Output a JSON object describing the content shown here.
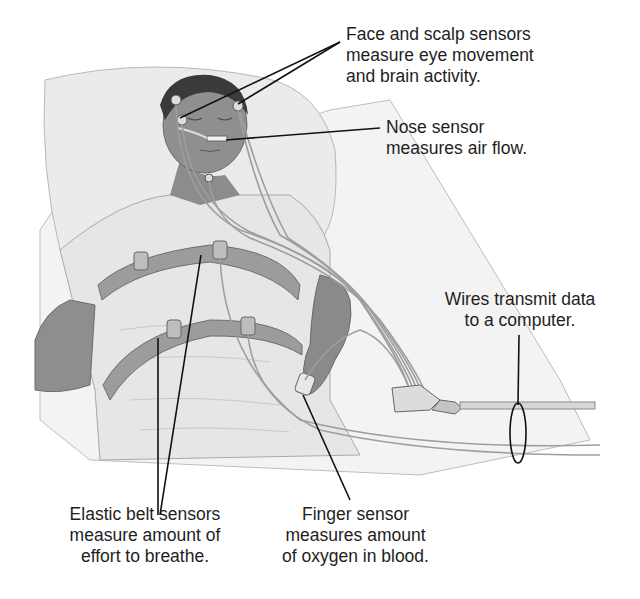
{
  "diagram": {
    "labels": {
      "face_scalp": {
        "lines": [
          "Face and scalp sensors",
          "measure eye movement",
          "and brain activity."
        ]
      },
      "nose": {
        "lines": [
          "Nose sensor",
          "measures air flow."
        ]
      },
      "wires": {
        "lines": [
          "Wires transmit data",
          "to a computer."
        ]
      },
      "belt": {
        "lines": [
          "Elastic belt sensors",
          "measure amount of",
          "effort to breathe."
        ]
      },
      "finger": {
        "lines": [
          "Finger sensor",
          "measures amount",
          "of oxygen in blood."
        ]
      }
    },
    "colors": {
      "background": "#ffffff",
      "text": "#1e1e1e",
      "leader_line": "#111111",
      "skin": "#8a8a8a",
      "hair": "#3a3a3a",
      "sheet": "#ececec",
      "belt": "#9a9a9a",
      "wire": "#b0b0b0"
    }
  }
}
